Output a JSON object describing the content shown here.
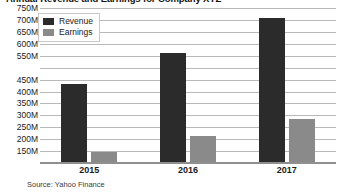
{
  "chart_data": {
    "type": "bar",
    "title": "Annual Revenue and Earnings for Company XYZ",
    "subtitle": "",
    "xlabel": "",
    "ylabel": "",
    "categories": [
      "2015",
      "2016",
      "2017"
    ],
    "series": [
      {
        "name": "Revenue",
        "color": "#2b2b2b",
        "values": [
          430,
          560,
          710
        ]
      },
      {
        "name": "Earnings",
        "color": "#8a8a8a",
        "values": [
          145,
          215,
          285
        ]
      }
    ],
    "units": "M",
    "ylim": [
      100,
      750
    ],
    "y_ticks": [
      750,
      700,
      650,
      600,
      550,
      500,
      450,
      400,
      350,
      300,
      250,
      200,
      150
    ],
    "y_tick_labels": [
      "750M",
      "700M",
      "650M",
      "600M",
      "550M",
      "450M",
      "400M",
      "350M",
      "300M",
      "250M",
      "200M",
      "150M"
    ],
    "grid": true,
    "legend_position": "top-left",
    "legend": [
      "Revenue",
      "Earnings"
    ],
    "annotations": [
      "Source: Yahoo Finance"
    ]
  },
  "legend": {
    "items": [
      {
        "label": "Revenue",
        "color": "#2b2b2b"
      },
      {
        "label": "Earnings",
        "color": "#8a8a8a"
      }
    ]
  },
  "footer": {
    "source": "Source: Yahoo Finance"
  }
}
